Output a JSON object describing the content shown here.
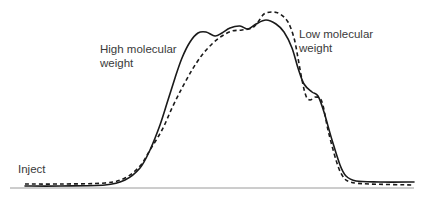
{
  "chart_data": {
    "type": "line",
    "title": "",
    "xlabel": "",
    "ylabel": "",
    "grid": false,
    "annotations": [
      {
        "text": "High molecular weight",
        "position": "upper-left of peak"
      },
      {
        "text": "Low molecular weight",
        "position": "upper-right of peak"
      },
      {
        "text": "Inject",
        "position": "bottom-left near baseline start"
      }
    ],
    "series": [
      {
        "name": "solid trace",
        "style": "solid",
        "color": "#1a1a1a",
        "points": [
          [
            25,
            186
          ],
          [
            60,
            186
          ],
          [
            105,
            185
          ],
          [
            125,
            180
          ],
          [
            140,
            168
          ],
          [
            150,
            150
          ],
          [
            160,
            125
          ],
          [
            168,
            100
          ],
          [
            175,
            78
          ],
          [
            182,
            58
          ],
          [
            190,
            42
          ],
          [
            198,
            33
          ],
          [
            206,
            32
          ],
          [
            215,
            36
          ],
          [
            222,
            33
          ],
          [
            230,
            28
          ],
          [
            240,
            26
          ],
          [
            248,
            29
          ],
          [
            256,
            24
          ],
          [
            266,
            20
          ],
          [
            276,
            24
          ],
          [
            284,
            32
          ],
          [
            292,
            48
          ],
          [
            298,
            68
          ],
          [
            304,
            84
          ],
          [
            312,
            92
          ],
          [
            318,
            96
          ],
          [
            324,
            112
          ],
          [
            332,
            140
          ],
          [
            340,
            165
          ],
          [
            346,
            176
          ],
          [
            356,
            181
          ],
          [
            380,
            182
          ],
          [
            414,
            182
          ]
        ]
      },
      {
        "name": "dashed trace",
        "style": "dashed",
        "color": "#1a1a1a",
        "points": [
          [
            25,
            184
          ],
          [
            60,
            184
          ],
          [
            105,
            183
          ],
          [
            125,
            178
          ],
          [
            140,
            166
          ],
          [
            150,
            150
          ],
          [
            162,
            130
          ],
          [
            172,
            108
          ],
          [
            182,
            88
          ],
          [
            192,
            70
          ],
          [
            202,
            55
          ],
          [
            212,
            44
          ],
          [
            222,
            36
          ],
          [
            232,
            31
          ],
          [
            242,
            30
          ],
          [
            252,
            28
          ],
          [
            258,
            22
          ],
          [
            264,
            14
          ],
          [
            272,
            12
          ],
          [
            280,
            14
          ],
          [
            288,
            22
          ],
          [
            294,
            38
          ],
          [
            298,
            58
          ],
          [
            302,
            80
          ],
          [
            306,
            96
          ],
          [
            310,
            100
          ],
          [
            316,
            97
          ],
          [
            322,
            102
          ],
          [
            328,
            130
          ],
          [
            336,
            160
          ],
          [
            342,
            175
          ],
          [
            350,
            182
          ],
          [
            370,
            184
          ],
          [
            414,
            185
          ]
        ]
      }
    ],
    "baseline": {
      "y": 188,
      "x_start": 10,
      "x_end": 414
    }
  },
  "labels": {
    "high": [
      "High molecular",
      "weight"
    ],
    "low": [
      "Low molecular",
      "weight"
    ],
    "inject": "Inject"
  },
  "colors": {
    "curve": "#1a1a1a",
    "axis": "#9a9a9a",
    "text": "#3a3a3a"
  }
}
